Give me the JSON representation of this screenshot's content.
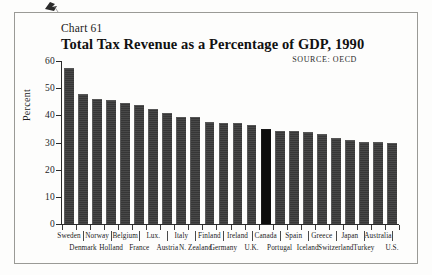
{
  "chart_number": "Chart 61",
  "source_note": "SOURCE:  OECD",
  "chart_data": {
    "type": "bar",
    "title": "Total Tax Revenue as a Percentage of GDP, 1990",
    "subtitle": "Chart 61",
    "annotations": [
      "SOURCE:  OECD"
    ],
    "xlabel": "",
    "ylabel": "Percent",
    "ylim": [
      0,
      60
    ],
    "yticks": [
      0,
      10,
      20,
      30,
      40,
      50,
      60
    ],
    "ytick_labels": [
      "0",
      "10",
      "20",
      "30",
      "40",
      "50",
      "60"
    ],
    "grid": false,
    "legend": "none",
    "highlight_category": "Canada",
    "highlight_color": "#0d0d0d",
    "bar_color": "#3a3a3a",
    "categories": [
      "Sweden",
      "Denmark",
      "Norway",
      "Holland",
      "Belgium",
      "France",
      "Lux.",
      "Austria",
      "Italy",
      "N. Zealand",
      "Finland",
      "Germany",
      "Ireland",
      "U.K.",
      "Canada",
      "Portugal",
      "Spain",
      "Iceland",
      "Greece",
      "Switzerland",
      "Japan",
      "Turkey",
      "Australia",
      "U.S."
    ],
    "values": [
      57.5,
      48.0,
      46.0,
      45.5,
      44.5,
      43.7,
      42.5,
      41.0,
      39.5,
      39.3,
      37.5,
      37.2,
      37.0,
      36.5,
      35.0,
      34.3,
      34.2,
      33.9,
      33.0,
      31.5,
      31.0,
      30.2,
      30.1,
      30.0
    ],
    "value_unit": "percent of GDP"
  },
  "x_label_rows": {
    "top": [
      "Sweden",
      "Norway",
      "Belgium",
      "Lux.",
      "Italy",
      "Finland",
      "Ireland",
      "Canada",
      "Spain",
      "Greece",
      "Japan",
      "Australia"
    ],
    "bottom": [
      "Denmark",
      "Holland",
      "France",
      "Austria",
      "N. Zealand",
      "Germany",
      "U.K.",
      "Portugal",
      "Iceland",
      "Switzerland",
      "Turkey",
      "U.S."
    ]
  },
  "ghost_text": [
    "",
    "",
    "",
    "",
    ""
  ]
}
